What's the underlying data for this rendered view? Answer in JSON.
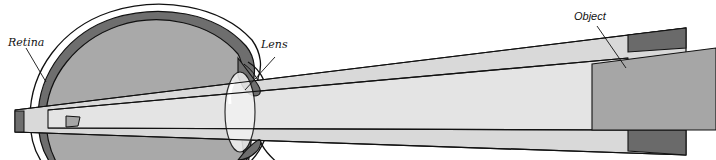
{
  "figure": {
    "labels": {
      "retina": "Retina",
      "lens": "Lens",
      "object": "Object"
    }
  },
  "colors": {
    "background": "#ffffff",
    "outline": "#111111",
    "eye_interior": "#a9a9a9",
    "choroid_dark": "#6e6e6e",
    "beam_light": "#d9d9d9",
    "beam_inner": "#e4e4e4",
    "object_face": "#a6a6a6",
    "object_dark": "#6a6a6a",
    "lens_highlight": "#f2f2f2"
  }
}
